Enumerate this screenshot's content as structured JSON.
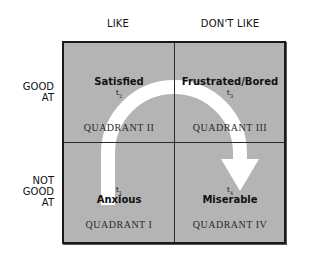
{
  "columns": [
    {
      "label": "LIKE"
    },
    {
      "label": "DON'T LIKE"
    }
  ],
  "rows": [
    {
      "lines": [
        "GOOD",
        "AT"
      ]
    },
    {
      "lines": [
        "NOT",
        "GOOD",
        "AT"
      ]
    }
  ],
  "quadrants": {
    "q2": {
      "emotion": "Satisfied",
      "time": "t",
      "time_sub": "2",
      "label": "QUADRANT II"
    },
    "q3": {
      "emotion": "Frustrated/Bored",
      "time": "t",
      "time_sub": "3",
      "label": "QUADRANT III"
    },
    "q1": {
      "emotion": "Anxious",
      "time": "t",
      "time_sub": "1",
      "label": "QUADRANT I"
    },
    "q4": {
      "emotion": "Miserable",
      "time": "t",
      "time_sub": "4",
      "label": "QUADRANT IV"
    }
  },
  "arrow": {
    "icon": "curved-arrow-icon",
    "path": "t1 -> t2 -> t3 -> t4",
    "color": "#ffffff"
  },
  "colors": {
    "cell_fill": "#b4b4b4",
    "border": "#1a1a1a",
    "text": "#111111"
  }
}
